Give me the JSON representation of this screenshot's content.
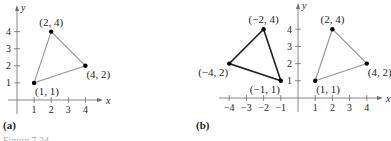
{
  "chart_data": [
    {
      "type": "scatter",
      "panel_label": "(a)",
      "xlabel": "x",
      "ylabel": "y",
      "xlim": [
        -1,
        5
      ],
      "ylim": [
        -1,
        5
      ],
      "xticks": [
        1,
        2,
        3,
        4
      ],
      "yticks": [
        1,
        2,
        3,
        4
      ],
      "grid": false,
      "series": [
        {
          "name": "original",
          "style": "light",
          "color": "#9b9a9a",
          "points": [
            {
              "x": 1,
              "y": 1,
              "label": "(1, 1)",
              "label_pos": "below-right"
            },
            {
              "x": 2,
              "y": 4,
              "label": "(2, 4)",
              "label_pos": "above"
            },
            {
              "x": 4,
              "y": 2,
              "label": "(4, 2)",
              "label_pos": "below-right"
            }
          ]
        }
      ]
    },
    {
      "type": "scatter",
      "panel_label": "(b)",
      "xlabel": "x",
      "ylabel": "y",
      "xlim": [
        -5,
        5
      ],
      "ylim": [
        -1,
        5
      ],
      "xticks": [
        -4,
        -3,
        -2,
        -1,
        1,
        2,
        3,
        4
      ],
      "xtick_labels": [
        "−4",
        "−3",
        "−2",
        "−1",
        "1",
        "2",
        "3",
        "4"
      ],
      "yticks": [
        1,
        2,
        3,
        4
      ],
      "grid": false,
      "series": [
        {
          "name": "reflected",
          "style": "dark",
          "color": "#231f20",
          "points": [
            {
              "x": -1,
              "y": 1,
              "label": "(−1, 1)",
              "label_pos": "below-left"
            },
            {
              "x": -2,
              "y": 4,
              "label": "(−2, 4)",
              "label_pos": "above"
            },
            {
              "x": -4,
              "y": 2,
              "label": "(−4, 2)",
              "label_pos": "below-left"
            }
          ]
        },
        {
          "name": "original",
          "style": "light",
          "color": "#9b9a9a",
          "points": [
            {
              "x": 1,
              "y": 1,
              "label": "(1, 1)",
              "label_pos": "below-right"
            },
            {
              "x": 2,
              "y": 4,
              "label": "(2, 4)",
              "label_pos": "above"
            },
            {
              "x": 4,
              "y": 2,
              "label": "(4, 2)",
              "label_pos": "below-right"
            }
          ]
        }
      ]
    }
  ],
  "caption": "Figure 7.24"
}
